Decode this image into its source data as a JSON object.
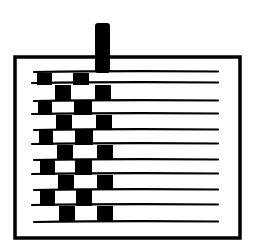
{
  "diagram": {
    "title": "",
    "colors": {
      "ink": "#000000",
      "background": "#ffffff"
    },
    "frame": {
      "x": 15,
      "y": 57,
      "width": 225,
      "height": 181
    },
    "post": {
      "x": 95,
      "y": 23,
      "width": 15,
      "height": 48
    },
    "weft_lines_y": [
      72,
      83,
      101,
      114,
      130,
      144,
      160,
      174,
      190,
      205,
      222
    ],
    "rows": [
      {
        "y": 73,
        "h": 12,
        "blocks": [
          [
            37,
            15
          ],
          [
            73,
            16
          ]
        ]
      },
      {
        "y": 85,
        "h": 16,
        "blocks": [
          [
            55,
            16
          ],
          [
            95,
            16
          ]
        ]
      },
      {
        "y": 101,
        "h": 14,
        "blocks": [
          [
            38,
            14
          ],
          [
            74,
            18
          ]
        ]
      },
      {
        "y": 115,
        "h": 15,
        "blocks": [
          [
            56,
            16
          ],
          [
            96,
            16
          ]
        ]
      },
      {
        "y": 130,
        "h": 15,
        "blocks": [
          [
            39,
            14
          ],
          [
            75,
            18
          ]
        ]
      },
      {
        "y": 145,
        "h": 15,
        "blocks": [
          [
            57,
            16
          ],
          [
            97,
            16
          ]
        ]
      },
      {
        "y": 160,
        "h": 15,
        "blocks": [
          [
            40,
            15
          ],
          [
            75,
            17
          ]
        ]
      },
      {
        "y": 175,
        "h": 15,
        "blocks": [
          [
            58,
            16
          ],
          [
            97,
            16
          ]
        ]
      },
      {
        "y": 190,
        "h": 16,
        "blocks": [
          [
            40,
            15
          ],
          [
            76,
            16
          ]
        ]
      },
      {
        "y": 206,
        "h": 16,
        "blocks": [
          [
            59,
            16
          ],
          [
            97,
            16
          ]
        ]
      }
    ]
  }
}
